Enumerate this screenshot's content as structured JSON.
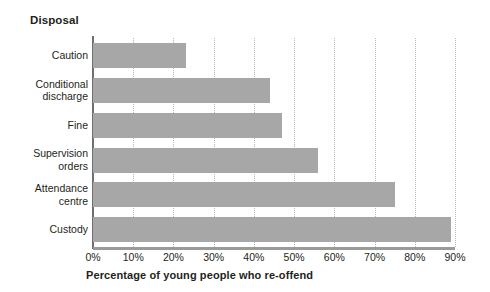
{
  "chart_data": {
    "type": "bar",
    "orientation": "horizontal",
    "title": "Disposal",
    "xlabel": "Percentage of young people who re-offend",
    "ylabel": "Disposal",
    "categories": [
      "Caution",
      "Conditional discharge",
      "Fine",
      "Supervision orders",
      "Attendance centre",
      "Custody"
    ],
    "category_lines": [
      [
        "Caution"
      ],
      [
        "Conditional",
        "discharge"
      ],
      [
        "Fine"
      ],
      [
        "Supervision",
        "orders"
      ],
      [
        "Attendance",
        "centre"
      ],
      [
        "Custody"
      ]
    ],
    "values": [
      23,
      44,
      47,
      56,
      75,
      89
    ],
    "xlim": [
      0,
      90
    ],
    "tick_labels": [
      "0%",
      "10%",
      "20%",
      "30%",
      "40%",
      "50%",
      "60%",
      "70%",
      "80%",
      "90%"
    ],
    "tick_values": [
      0,
      10,
      20,
      30,
      40,
      50,
      60,
      70,
      80,
      90
    ],
    "grid": "vertical-dotted",
    "legend": null,
    "bar_color": "#a7a7a7",
    "grid_color": "#b9b9b9",
    "axis_color": "#6f6f6f",
    "text_color": "#231f20",
    "background": "#ffffff"
  }
}
